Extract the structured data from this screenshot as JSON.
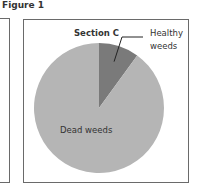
{
  "figure": {
    "title": "Figure 1"
  },
  "chart_data": {
    "type": "pie",
    "title": "Section C",
    "categories": [
      "Healthy weeds",
      "Dead weeds"
    ],
    "values": [
      10,
      90
    ],
    "units": "percent (estimated)",
    "start_angle_deg": 0,
    "direction": "clockwise",
    "colors": {
      "Healthy weeds": "#7a7a7a",
      "Dead weeds": "#b5b5b5"
    },
    "labels": {
      "healthy_line1": "Healthy",
      "healthy_line2": "weeds",
      "dead": "Dead weeds"
    },
    "legend": "none"
  }
}
